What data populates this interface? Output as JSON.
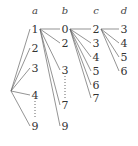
{
  "diagram": {
    "type": "tree",
    "root": {
      "x": 11,
      "y": 91
    },
    "columns": [
      {
        "name": "a",
        "x": 35,
        "header_y": 14,
        "nodes": [
          {
            "label": "1",
            "y": 32
          },
          {
            "label": "2",
            "y": 51
          },
          {
            "label": "3",
            "y": 71
          },
          {
            "label": "4",
            "y": 98
          },
          {
            "label": "9",
            "y": 129
          }
        ],
        "ellipsis_between": [
          "4",
          "9"
        ]
      },
      {
        "name": "b",
        "x": 65,
        "header_y": 14,
        "nodes": [
          {
            "label": "0",
            "y": 32
          },
          {
            "label": "2",
            "y": 46
          },
          {
            "label": "3",
            "y": 73
          },
          {
            "label": "7",
            "y": 108
          },
          {
            "label": "9",
            "y": 129
          }
        ],
        "ellipsis_between": [
          "3",
          "7"
        ]
      },
      {
        "name": "c",
        "x": 96,
        "header_y": 14,
        "nodes": [
          {
            "label": "2",
            "y": 32
          },
          {
            "label": "3",
            "y": 46
          },
          {
            "label": "4",
            "y": 60
          },
          {
            "label": "5",
            "y": 74
          },
          {
            "label": "6",
            "y": 88
          },
          {
            "label": "7",
            "y": 101
          }
        ]
      },
      {
        "name": "d",
        "x": 124,
        "header_y": 14,
        "nodes": [
          {
            "label": "3",
            "y": 32
          },
          {
            "label": "4",
            "y": 46
          },
          {
            "label": "5",
            "y": 60
          },
          {
            "label": "6",
            "y": 74
          }
        ]
      }
    ],
    "branching": {
      "root_to": "a",
      "a_parent": "1",
      "b_parent": "0",
      "c_parent": "2"
    }
  }
}
